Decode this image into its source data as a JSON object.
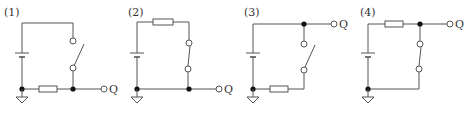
{
  "colors": {
    "wire": "#555555",
    "node": "#111111",
    "background": "#ffffff"
  },
  "circuits": [
    {
      "label": "(1)",
      "output": "Q",
      "switch_state": "open",
      "resistor_position": "bottom",
      "output_side": "bottom"
    },
    {
      "label": "(2)",
      "output": "Q",
      "switch_state": "closed",
      "resistor_position": "top",
      "output_side": "bottom"
    },
    {
      "label": "(3)",
      "output": "Q",
      "switch_state": "open",
      "resistor_position": "bottom",
      "output_side": "top"
    },
    {
      "label": "(4)",
      "output": "Q",
      "switch_state": "closed",
      "resistor_position": "top",
      "output_side": "top"
    }
  ]
}
